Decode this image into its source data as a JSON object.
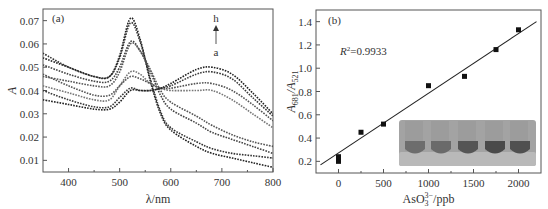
{
  "chart_data": [
    {
      "id": "a",
      "type": "line",
      "panel_label": "(a)",
      "title": "",
      "xlabel": "λ/nm",
      "ylabel": "A",
      "xlim": [
        350,
        800
      ],
      "ylim": [
        0.005,
        0.075
      ],
      "xticks": [
        400,
        500,
        600,
        700,
        800
      ],
      "yticks": [
        0.01,
        0.02,
        0.03,
        0.04,
        0.05,
        0.06,
        0.07
      ],
      "ytick_labels": [
        "0.01",
        "0.02",
        "0.03",
        "0.04",
        "0.05",
        "0.06",
        "0.07"
      ],
      "grid": false,
      "line_style": "dotted-markers",
      "annotation": {
        "top": "h",
        "bottom": "a",
        "arrow": "up"
      },
      "x": [
        350,
        400,
        450,
        480,
        500,
        521,
        540,
        560,
        580,
        600,
        650,
        681,
        720,
        760,
        800
      ],
      "series": [
        {
          "name": "a",
          "values": [
            0.054,
            0.05,
            0.046,
            0.046,
            0.055,
            0.071,
            0.062,
            0.044,
            0.03,
            0.023,
            0.016,
            0.013,
            0.011,
            0.009,
            0.007
          ]
        },
        {
          "name": "b",
          "values": [
            0.056,
            0.05,
            0.046,
            0.046,
            0.054,
            0.069,
            0.061,
            0.045,
            0.031,
            0.024,
            0.018,
            0.015,
            0.013,
            0.012,
            0.011
          ]
        },
        {
          "name": "c",
          "values": [
            0.051,
            0.047,
            0.044,
            0.044,
            0.05,
            0.061,
            0.057,
            0.048,
            0.038,
            0.032,
            0.026,
            0.022,
            0.019,
            0.016,
            0.013
          ]
        },
        {
          "name": "d",
          "values": [
            0.046,
            0.044,
            0.042,
            0.042,
            0.048,
            0.06,
            0.057,
            0.049,
            0.04,
            0.035,
            0.029,
            0.025,
            0.021,
            0.018,
            0.016
          ]
        },
        {
          "name": "e",
          "values": [
            0.042,
            0.039,
            0.036,
            0.036,
            0.042,
            0.048,
            0.047,
            0.043,
            0.041,
            0.04,
            0.04,
            0.04,
            0.036,
            0.03,
            0.024
          ]
        },
        {
          "name": "f",
          "values": [
            0.047,
            0.042,
            0.038,
            0.038,
            0.042,
            0.046,
            0.045,
            0.043,
            0.041,
            0.041,
            0.043,
            0.043,
            0.04,
            0.034,
            0.027
          ]
        },
        {
          "name": "g",
          "values": [
            0.04,
            0.036,
            0.033,
            0.033,
            0.037,
            0.041,
            0.04,
            0.04,
            0.041,
            0.042,
            0.047,
            0.048,
            0.045,
            0.037,
            0.029
          ]
        },
        {
          "name": "h",
          "values": [
            0.036,
            0.034,
            0.032,
            0.032,
            0.035,
            0.04,
            0.04,
            0.04,
            0.041,
            0.043,
            0.049,
            0.05,
            0.047,
            0.039,
            0.03
          ]
        }
      ]
    },
    {
      "id": "b",
      "type": "scatter",
      "panel_label": "(b)",
      "title": "",
      "xlabel": "AsO₃³⁻/ppb",
      "ylabel": "A681/A521",
      "ylabel_main": "A",
      "ylabel_sub1": "681",
      "ylabel_sub2": "521",
      "xlim": [
        -250,
        2250
      ],
      "ylim": [
        0.1,
        1.5
      ],
      "xticks": [
        0,
        500,
        1000,
        1500,
        2000
      ],
      "yticks": [
        0.2,
        0.4,
        0.6,
        0.8,
        1.0,
        1.2,
        1.4
      ],
      "ytick_labels": [
        "0.2",
        "0.4",
        "0.6",
        "0.8",
        "1.0",
        "1.2",
        "1.4"
      ],
      "grid": false,
      "annotation": "R²=0.9933",
      "annotation_main": "R",
      "annotation_sup": "2",
      "annotation_rest": "=0.9933",
      "points": [
        {
          "x": 0,
          "y": 0.2
        },
        {
          "x": 0,
          "y": 0.24
        },
        {
          "x": 250,
          "y": 0.45
        },
        {
          "x": 500,
          "y": 0.52
        },
        {
          "x": 1000,
          "y": 0.85
        },
        {
          "x": 1400,
          "y": 0.93
        },
        {
          "x": 1750,
          "y": 1.16
        },
        {
          "x": 2000,
          "y": 1.33
        }
      ],
      "fit_line": {
        "x": [
          -200,
          2200
        ],
        "y": [
          0.17,
          1.4
        ]
      },
      "inset": {
        "description": "photo of 5 vials",
        "vial_count": 5
      }
    }
  ],
  "colors": {
    "axis": "#555555",
    "series": [
      "#222222",
      "#333333",
      "#444444",
      "#555555",
      "#777777",
      "#555555",
      "#3a3a3a",
      "#222222"
    ],
    "marker": "#111111",
    "inset_bg": "#9a9a9a"
  }
}
